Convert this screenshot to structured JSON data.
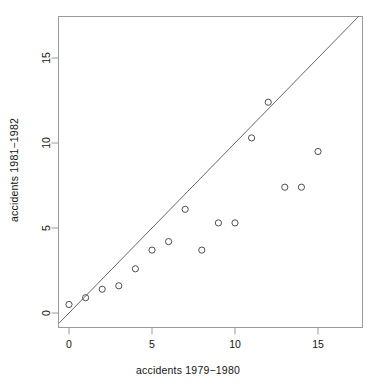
{
  "chart_data": {
    "type": "scatter",
    "title": "",
    "xlabel": "accidents 1979−1980",
    "ylabel": "accidents 1981−1982",
    "xlim": [
      -0.6,
      17.5
    ],
    "ylim": [
      -0.7,
      17.6
    ],
    "xticks": [
      0,
      5,
      10,
      15
    ],
    "yticks": [
      0,
      5,
      10,
      15
    ],
    "xtick_labels": [
      "0",
      "5",
      "10",
      "15"
    ],
    "ytick_labels": [
      "0",
      "5",
      "10",
      "15"
    ],
    "grid": false,
    "legend": false,
    "point_style": "open-circle",
    "point_color": "#4d4d4d",
    "frame_color": "#999999",
    "line_color": "#555555",
    "x": [
      0,
      1,
      2,
      3,
      4,
      5,
      6,
      7,
      8,
      9,
      10,
      11,
      12,
      13,
      14,
      15
    ],
    "y": [
      0.5,
      0.9,
      1.4,
      1.6,
      2.6,
      3.7,
      4.2,
      6.1,
      3.7,
      5.3,
      5.3,
      10.3,
      12.4,
      7.4,
      7.4,
      9.5
    ],
    "points": [
      {
        "x": 0,
        "y": 0.5
      },
      {
        "x": 1,
        "y": 0.9
      },
      {
        "x": 2,
        "y": 1.4
      },
      {
        "x": 3,
        "y": 1.6
      },
      {
        "x": 4,
        "y": 2.6
      },
      {
        "x": 5,
        "y": 3.7
      },
      {
        "x": 6,
        "y": 4.2
      },
      {
        "x": 7,
        "y": 6.1
      },
      {
        "x": 8,
        "y": 3.7
      },
      {
        "x": 9,
        "y": 5.3
      },
      {
        "x": 10,
        "y": 5.3
      },
      {
        "x": 11,
        "y": 10.3
      },
      {
        "x": 12,
        "y": 12.4
      },
      {
        "x": 13,
        "y": 7.4
      },
      {
        "x": 14,
        "y": 7.4
      },
      {
        "x": 15,
        "y": 9.5
      }
    ],
    "reference_line": {
      "type": "identity",
      "slope": 1,
      "intercept": 0,
      "label": "y = x"
    }
  }
}
